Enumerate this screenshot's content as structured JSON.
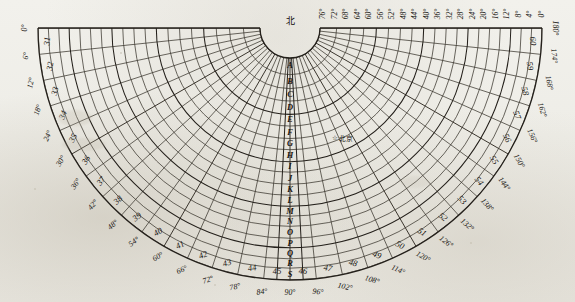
{
  "chart_data": {
    "type": "polar_grid_table",
    "title": "北",
    "title_meaning_label": "北",
    "subtitle": "",
    "grid": true,
    "legend": "",
    "center_marker": {
      "symbol": "☆",
      "label": "北京"
    },
    "outer_numbers": [
      "31",
      "32",
      "33",
      "34",
      "35",
      "36",
      "37",
      "38",
      "39",
      "40",
      "41",
      "42",
      "43",
      "44",
      "45",
      "46",
      "47",
      "48",
      "49",
      "50",
      "51",
      "52",
      "53",
      "54",
      "55",
      "56",
      "57",
      "58",
      "59",
      "60"
    ],
    "outer_degrees": [
      "0°",
      "6°",
      "12°",
      "18°",
      "24°",
      "30°",
      "36°",
      "42°",
      "48°",
      "54°",
      "60°",
      "66°",
      "72°",
      "78°",
      "84°",
      "90°",
      "96°",
      "102°",
      "108°",
      "114°",
      "120°",
      "126°",
      "132°",
      "138°",
      "144°",
      "150°",
      "156°",
      "162°",
      "168°",
      "174°",
      "180°"
    ],
    "top_degrees_right": [
      "76°",
      "72°",
      "68°",
      "64°",
      "60°",
      "56°",
      "52°",
      "48°",
      "44°",
      "40°",
      "36°",
      "32°",
      "28°",
      "24°",
      "20°",
      "16°",
      "12°",
      "8°",
      "4°",
      "0°"
    ],
    "center_letters": [
      "S",
      "R",
      "Q",
      "P",
      "O",
      "N",
      "M",
      "L",
      "K",
      "J",
      "I",
      "H",
      "G",
      "F",
      "E",
      "D",
      "C",
      "B",
      "A"
    ],
    "center_letter_bottom": "A",
    "axis_step_outer_deg": 6,
    "axis_step_top_deg": 4,
    "radial_count": 30,
    "ring_count": 19,
    "colors": {
      "paper": "#eeede7",
      "ink": "#24201b",
      "grid": "#3a352d",
      "text": "#15130f"
    }
  },
  "page": {
    "north_label": "北",
    "city_star": "☆",
    "city_name": "北京"
  }
}
